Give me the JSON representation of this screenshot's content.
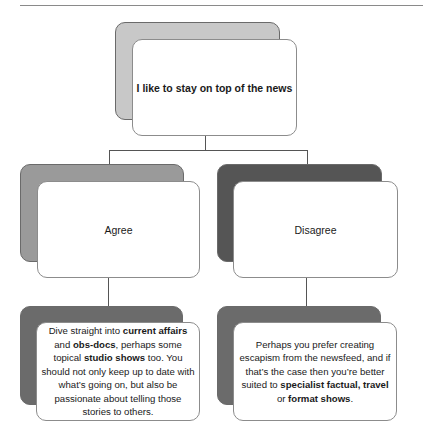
{
  "diagram": {
    "root": {
      "label": "I like to stay on top of the news",
      "back_color": "#c8c8c8"
    },
    "branches": [
      {
        "label": "Agree",
        "back_color": "#9a9a9a",
        "result": {
          "segments": [
            {
              "text": "Dive straight into ",
              "bold": false
            },
            {
              "text": "current affairs",
              "bold": true
            },
            {
              "text": " and ",
              "bold": false
            },
            {
              "text": "obs-docs",
              "bold": true
            },
            {
              "text": ", perhaps some topical ",
              "bold": false
            },
            {
              "text": "studio shows",
              "bold": true
            },
            {
              "text": " too. You should not only keep up to date with what’s going on, but also be passionate about telling those stories to others.",
              "bold": false
            }
          ],
          "back_color": "#6b6b6b"
        }
      },
      {
        "label": "Disagree",
        "back_color": "#555555",
        "result": {
          "segments": [
            {
              "text": "Perhaps you prefer creating escapism from the newsfeed, and if that’s the case then you’re better suited to ",
              "bold": false
            },
            {
              "text": "specialist factual, travel",
              "bold": true
            },
            {
              "text": " or ",
              "bold": false
            },
            {
              "text": "format shows",
              "bold": true
            },
            {
              "text": ".",
              "bold": false
            }
          ],
          "back_color": "#6b6b6b"
        }
      }
    ]
  },
  "colors": {
    "connector": "#555555",
    "card_border": "#8c8c8c",
    "card_fill": "#ffffff"
  }
}
